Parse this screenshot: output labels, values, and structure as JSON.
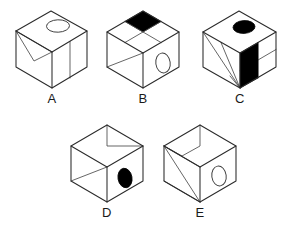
{
  "figure": {
    "type": "spatial-reasoning-cube-puzzle",
    "background_color": "#ffffff",
    "line_color": "#2b2b2b",
    "fill_color": "#000000",
    "option_count": 5
  },
  "options": [
    {
      "label": "A",
      "name": "cube-a",
      "top_face": {
        "marking": "open-ellipse",
        "fill": "none",
        "divisions": "none"
      },
      "left_face": {
        "marking": "v-triangle-outline",
        "fill": "none",
        "divisions": "triangle"
      },
      "right_face": {
        "marking": "vertical-divider",
        "fill": "none",
        "divisions": "two-vertical-panels"
      }
    },
    {
      "label": "B",
      "name": "cube-b",
      "top_face": {
        "marking": "quadrants",
        "fill": "back-quadrant-black",
        "divisions": "2x2"
      },
      "left_face": {
        "marking": "diagonal",
        "fill": "none",
        "divisions": "diagonal-split"
      },
      "right_face": {
        "marking": "open-ellipse",
        "fill": "none",
        "divisions": "none"
      }
    },
    {
      "label": "C",
      "name": "cube-c",
      "top_face": {
        "marking": "solid-ellipse",
        "fill": "black",
        "divisions": "none"
      },
      "left_face": {
        "marking": "fan-triangles",
        "fill": "none",
        "divisions": "three-lines-from-corner"
      },
      "right_face": {
        "marking": "quadrants",
        "fill": "top-left-quadrant-black",
        "divisions": "2x2"
      }
    },
    {
      "label": "D",
      "name": "cube-d",
      "top_face": {
        "marking": "stepped-triangle-outline",
        "fill": "none",
        "divisions": "notch"
      },
      "left_face": {
        "marking": "diagonal",
        "fill": "none",
        "divisions": "diagonal-split"
      },
      "right_face": {
        "marking": "solid-ellipse",
        "fill": "black",
        "divisions": "none"
      }
    },
    {
      "label": "E",
      "name": "cube-e",
      "top_face": {
        "marking": "stepped-triangle-outline",
        "fill": "none",
        "divisions": "notch"
      },
      "left_face": {
        "marking": "fan-triangles",
        "fill": "none",
        "divisions": "two-lines-from-corner"
      },
      "right_face": {
        "marking": "open-ellipse",
        "fill": "none",
        "divisions": "none"
      }
    }
  ]
}
